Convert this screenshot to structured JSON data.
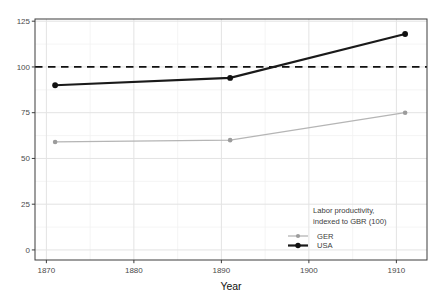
{
  "figure": {
    "width": 444,
    "height": 299,
    "background": "#ffffff"
  },
  "chart_data": {
    "type": "line",
    "title": "",
    "xlabel": "Year",
    "ylabel": "",
    "x": [
      1871,
      1891,
      1911
    ],
    "series": [
      {
        "name": "GER",
        "values": [
          59,
          60,
          75
        ],
        "color": "#b5b5b5",
        "marker_color": "#9c9c9c",
        "line_width": 1.3,
        "marker_radius": 2.3
      },
      {
        "name": "USA",
        "values": [
          90,
          94,
          118
        ],
        "color": "#1a1a1a",
        "marker_color": "#111111",
        "line_width": 2.2,
        "marker_radius": 2.9
      }
    ],
    "reference_line": {
      "y": 100,
      "style": "dashed",
      "color": "#111111"
    },
    "x_ticks": {
      "values": [
        1870,
        1880,
        1890,
        1900,
        1910
      ],
      "labels": [
        "1870",
        "1880",
        "1890",
        "1900",
        "1910"
      ]
    },
    "y_ticks": {
      "values": [
        0,
        25,
        50,
        75,
        100,
        125
      ],
      "labels": [
        "0",
        "25",
        "50",
        "75",
        "100",
        "125"
      ]
    },
    "x_minor_ticks": [
      1875,
      1885,
      1895,
      1905
    ],
    "y_minor_ticks": [
      12.5,
      37.5,
      62.5,
      87.5,
      112.5
    ],
    "xlim": [
      1868.7,
      1913.5
    ],
    "ylim": [
      -5.5,
      126.2
    ],
    "grid": {
      "major": true,
      "minor": true,
      "major_color": "#e3e3e3",
      "minor_color": "#f1f1f1"
    },
    "legend": {
      "title_lines": [
        "Labor productivity,",
        "indexed to GBR (100)"
      ],
      "entries": [
        "GER",
        "USA"
      ],
      "position": "inside bottom-right"
    },
    "style": {
      "panel_border_color": "#3c3c3c",
      "tick_color": "#3c3c3c",
      "tick_label_color": "#4b4b4b",
      "axis_title_color": "#111111",
      "legend_text_color": "#3d3d3d"
    }
  }
}
